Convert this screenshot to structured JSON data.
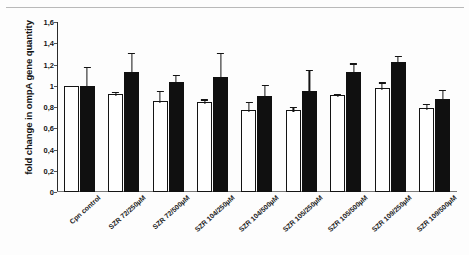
{
  "chart_data": {
    "type": "bar",
    "title": "",
    "xlabel": "",
    "ylabel": "fold change in  ompA gene quantity",
    "ylim": [
      0,
      1.6
    ],
    "ytick_labels": [
      "1,6",
      "1,4",
      "1,2",
      "1",
      "0,8",
      "0,6",
      "0,4",
      "0,2",
      "0"
    ],
    "ytick_values": [
      1.6,
      1.4,
      1.2,
      1.0,
      0.8,
      0.6,
      0.4,
      0.2,
      0
    ],
    "grid": false,
    "legend": "none",
    "categories": [
      "Cpn control",
      "SZR 72/250µM",
      "SZR 72/500µM",
      "SZR 104/250µM",
      "SZR 104/500µM",
      "SZR 105/250µM",
      "SZR 105/500µM",
      "SZR 109/250µM",
      "SZR 109/500µM"
    ],
    "series": [
      {
        "name": "white-bar",
        "fill": "#ffffff",
        "edge": "#141414",
        "values": [
          1.0,
          0.92,
          0.86,
          0.85,
          0.77,
          0.77,
          0.91,
          0.98,
          0.79
        ],
        "errors": [
          0.0,
          0.04,
          0.11,
          0.04,
          0.1,
          0.05,
          0.03,
          0.07,
          0.06
        ]
      },
      {
        "name": "black-bar",
        "fill": "#101010",
        "edge": "#101010",
        "values": [
          1.0,
          1.13,
          1.04,
          1.08,
          0.9,
          0.95,
          1.13,
          1.22,
          0.88
        ],
        "errors": [
          0.2,
          0.2,
          0.08,
          0.25,
          0.13,
          0.22,
          0.1,
          0.08,
          0.1
        ]
      }
    ]
  }
}
